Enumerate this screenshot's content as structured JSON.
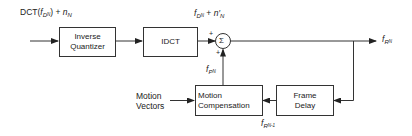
{
  "diagram": {
    "type": "block-diagram",
    "title": "",
    "blocks": [
      {
        "id": "inverse_quantizer",
        "lines": [
          "Inverse",
          "Quantizer"
        ]
      },
      {
        "id": "idct",
        "lines": [
          "IDCT"
        ]
      },
      {
        "id": "motion_compensation",
        "lines": [
          "Motion",
          "Compensation"
        ]
      },
      {
        "id": "frame_delay",
        "lines": [
          "Frame",
          "Delay"
        ]
      }
    ],
    "summer": {
      "symbol": "Σ",
      "sign_top_left": "+",
      "sign_bottom": "+"
    },
    "labels": {
      "input": {
        "prefix": "DCT(",
        "f": "f",
        "sub": "D",
        "subsub": "N",
        "suffix": ") + ",
        "n": "n",
        "n_sub": "N"
      },
      "idct_out": {
        "f": "f",
        "sub": "D",
        "subsub": "N",
        "plus": " + ",
        "n": "n′",
        "n_sub": "N"
      },
      "output": {
        "f": "f",
        "sub": "R",
        "subsub": "N"
      },
      "prediction": {
        "f": "f",
        "sub": "P",
        "subsub": "N"
      },
      "delayed": {
        "f": "f",
        "sub": "R",
        "subsub": "N-1"
      },
      "motion_vectors": [
        "Motion",
        "Vectors"
      ]
    },
    "connections": [
      {
        "from": "input",
        "to": "inverse_quantizer"
      },
      {
        "from": "inverse_quantizer",
        "to": "idct"
      },
      {
        "from": "idct",
        "to": "summer"
      },
      {
        "from": "summer",
        "to": "output"
      },
      {
        "from": "output",
        "to": "frame_delay"
      },
      {
        "from": "frame_delay",
        "to": "motion_compensation"
      },
      {
        "from": "motion_vectors",
        "to": "motion_compensation"
      },
      {
        "from": "motion_compensation",
        "to": "summer"
      }
    ]
  }
}
